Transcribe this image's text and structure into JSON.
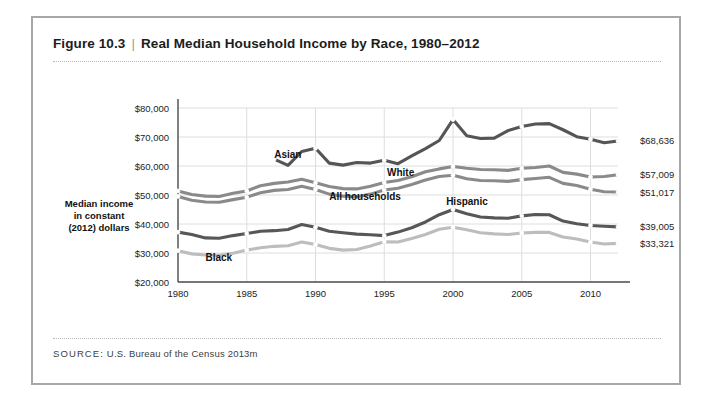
{
  "figure": {
    "number": "Figure 10.3",
    "divider": "|",
    "title": "Real Median Household Income by Race, 1980–2012",
    "source_label": "SOURCE:",
    "source_text": " U.S. Bureau of the Census 2013m"
  },
  "axis": {
    "y_title_line1": "Median income",
    "y_title_line2": "in constant",
    "y_title_line3": "(2012) dollars"
  },
  "chart_data": {
    "type": "line",
    "title": "Real Median Household Income by Race, 1980–2012",
    "xlabel": "",
    "ylabel": "Median income in constant (2012) dollars",
    "xlim": [
      1980,
      2012
    ],
    "ylim": [
      20000,
      80000
    ],
    "ytick_values": [
      20000,
      30000,
      40000,
      50000,
      60000,
      70000,
      80000
    ],
    "ytick_labels": [
      "$20,000",
      "$30,000",
      "$40,000",
      "$50,000",
      "$60,000",
      "$70,000",
      "$80,000"
    ],
    "xtick_values": [
      1980,
      1985,
      1990,
      1995,
      2000,
      2005,
      2010
    ],
    "xtick_labels": [
      "1980",
      "1985",
      "1990",
      "1995",
      "2000",
      "2005",
      "2010"
    ],
    "grid": true,
    "legend": "inline-annotations",
    "series": [
      {
        "name": "Asian",
        "color": "#555555",
        "label": "Asian",
        "label_x": 1987.0,
        "label_y": 62600,
        "end_label": "$68,636",
        "x": [
          1987,
          1988,
          1989,
          1990,
          1991,
          1992,
          1993,
          1994,
          1995,
          1996,
          1997,
          1998,
          1999,
          2000,
          2001,
          2002,
          2003,
          2004,
          2005,
          2006,
          2007,
          2008,
          2009,
          2010,
          2011,
          2012
        ],
        "y": [
          62400,
          60200,
          65000,
          66100,
          61000,
          60300,
          61200,
          61000,
          62000,
          60800,
          63500,
          66000,
          68800,
          76000,
          70400,
          69500,
          69600,
          72200,
          73600,
          74500,
          74600,
          72500,
          70100,
          69200,
          68000,
          68636
        ]
      },
      {
        "name": "White",
        "color": "#8a8a8a",
        "label": "White",
        "label_x": 1995.2,
        "label_y": 56600,
        "end_label": "$57,009",
        "x": [
          1980,
          1981,
          1982,
          1983,
          1984,
          1985,
          1986,
          1987,
          1988,
          1989,
          1990,
          1991,
          1992,
          1993,
          1994,
          1995,
          1996,
          1997,
          1998,
          1999,
          2000,
          2001,
          2002,
          2003,
          2004,
          2005,
          2006,
          2007,
          2008,
          2009,
          2010,
          2011,
          2012
        ],
        "y": [
          51400,
          50200,
          49600,
          49500,
          50600,
          51400,
          53200,
          54000,
          54500,
          55400,
          54200,
          52900,
          52200,
          52100,
          53000,
          54300,
          55000,
          56300,
          58000,
          59000,
          59800,
          59200,
          58800,
          58700,
          58500,
          59200,
          59500,
          60000,
          57800,
          57200,
          56200,
          56400,
          57009
        ]
      },
      {
        "name": "All households",
        "color": "#8a8a8a",
        "label": "All households",
        "label_x": 1991.0,
        "label_y": 48200,
        "end_label": "$51,017",
        "x": [
          1980,
          1981,
          1982,
          1983,
          1984,
          1985,
          1986,
          1987,
          1988,
          1989,
          1990,
          1991,
          1992,
          1993,
          1994,
          1995,
          1996,
          1997,
          1998,
          1999,
          2000,
          2001,
          2002,
          2003,
          2004,
          2005,
          2006,
          2007,
          2008,
          2009,
          2010,
          2011,
          2012
        ],
        "y": [
          49500,
          48200,
          47600,
          47500,
          48400,
          49200,
          50800,
          51600,
          51900,
          53000,
          51900,
          50300,
          49600,
          49400,
          50300,
          51700,
          52300,
          53600,
          55200,
          56400,
          56800,
          55600,
          55000,
          54900,
          54700,
          55300,
          55700,
          56100,
          54000,
          53300,
          52000,
          51100,
          51017
        ]
      },
      {
        "name": "Hispanic",
        "color": "#575757",
        "label": "Hispanic",
        "label_x": 1999.5,
        "label_y": 46600,
        "end_label": "$39,005",
        "x": [
          1980,
          1981,
          1982,
          1983,
          1984,
          1985,
          1986,
          1987,
          1988,
          1989,
          1990,
          1991,
          1992,
          1993,
          1994,
          1995,
          1996,
          1997,
          1998,
          1999,
          2000,
          2001,
          2002,
          2003,
          2004,
          2005,
          2006,
          2007,
          2008,
          2009,
          2010,
          2011,
          2012
        ],
        "y": [
          37200,
          36400,
          35200,
          35100,
          36000,
          36700,
          37500,
          37700,
          38100,
          39800,
          38900,
          37500,
          37000,
          36500,
          36300,
          36000,
          37200,
          38700,
          40700,
          43200,
          45000,
          43500,
          42400,
          42100,
          42000,
          42800,
          43300,
          43200,
          41000,
          40100,
          39500,
          39200,
          39005
        ]
      },
      {
        "name": "Black",
        "color": "#bdbdbd",
        "label": "Black",
        "label_x": 1982.0,
        "label_y": 27200,
        "end_label": "$33,321",
        "x": [
          1980,
          1981,
          1982,
          1983,
          1984,
          1985,
          1986,
          1987,
          1988,
          1989,
          1990,
          1991,
          1992,
          1993,
          1994,
          1995,
          1996,
          1997,
          1998,
          1999,
          2000,
          2001,
          2002,
          2003,
          2004,
          2005,
          2006,
          2007,
          2008,
          2009,
          2010,
          2011,
          2012
        ],
        "y": [
          30800,
          29700,
          29300,
          29200,
          29900,
          31000,
          31800,
          32300,
          32500,
          33800,
          32900,
          31600,
          31000,
          31200,
          32400,
          33900,
          33800,
          35000,
          36400,
          38200,
          38900,
          38000,
          37000,
          36600,
          36400,
          36900,
          37100,
          37100,
          35500,
          34800,
          33800,
          33100,
          33321
        ]
      }
    ]
  }
}
